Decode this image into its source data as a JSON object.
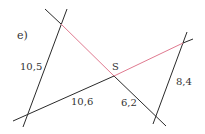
{
  "task_label": "e)",
  "center_point": "S",
  "segments": {
    "left_transversal": "10,5",
    "bottom_left": "10,6",
    "bottom_right": "6,2",
    "right_transversal": "8,4"
  },
  "colors": {
    "line": "#2a2a2a",
    "highlight": "#e07a90",
    "text": "#333333"
  }
}
